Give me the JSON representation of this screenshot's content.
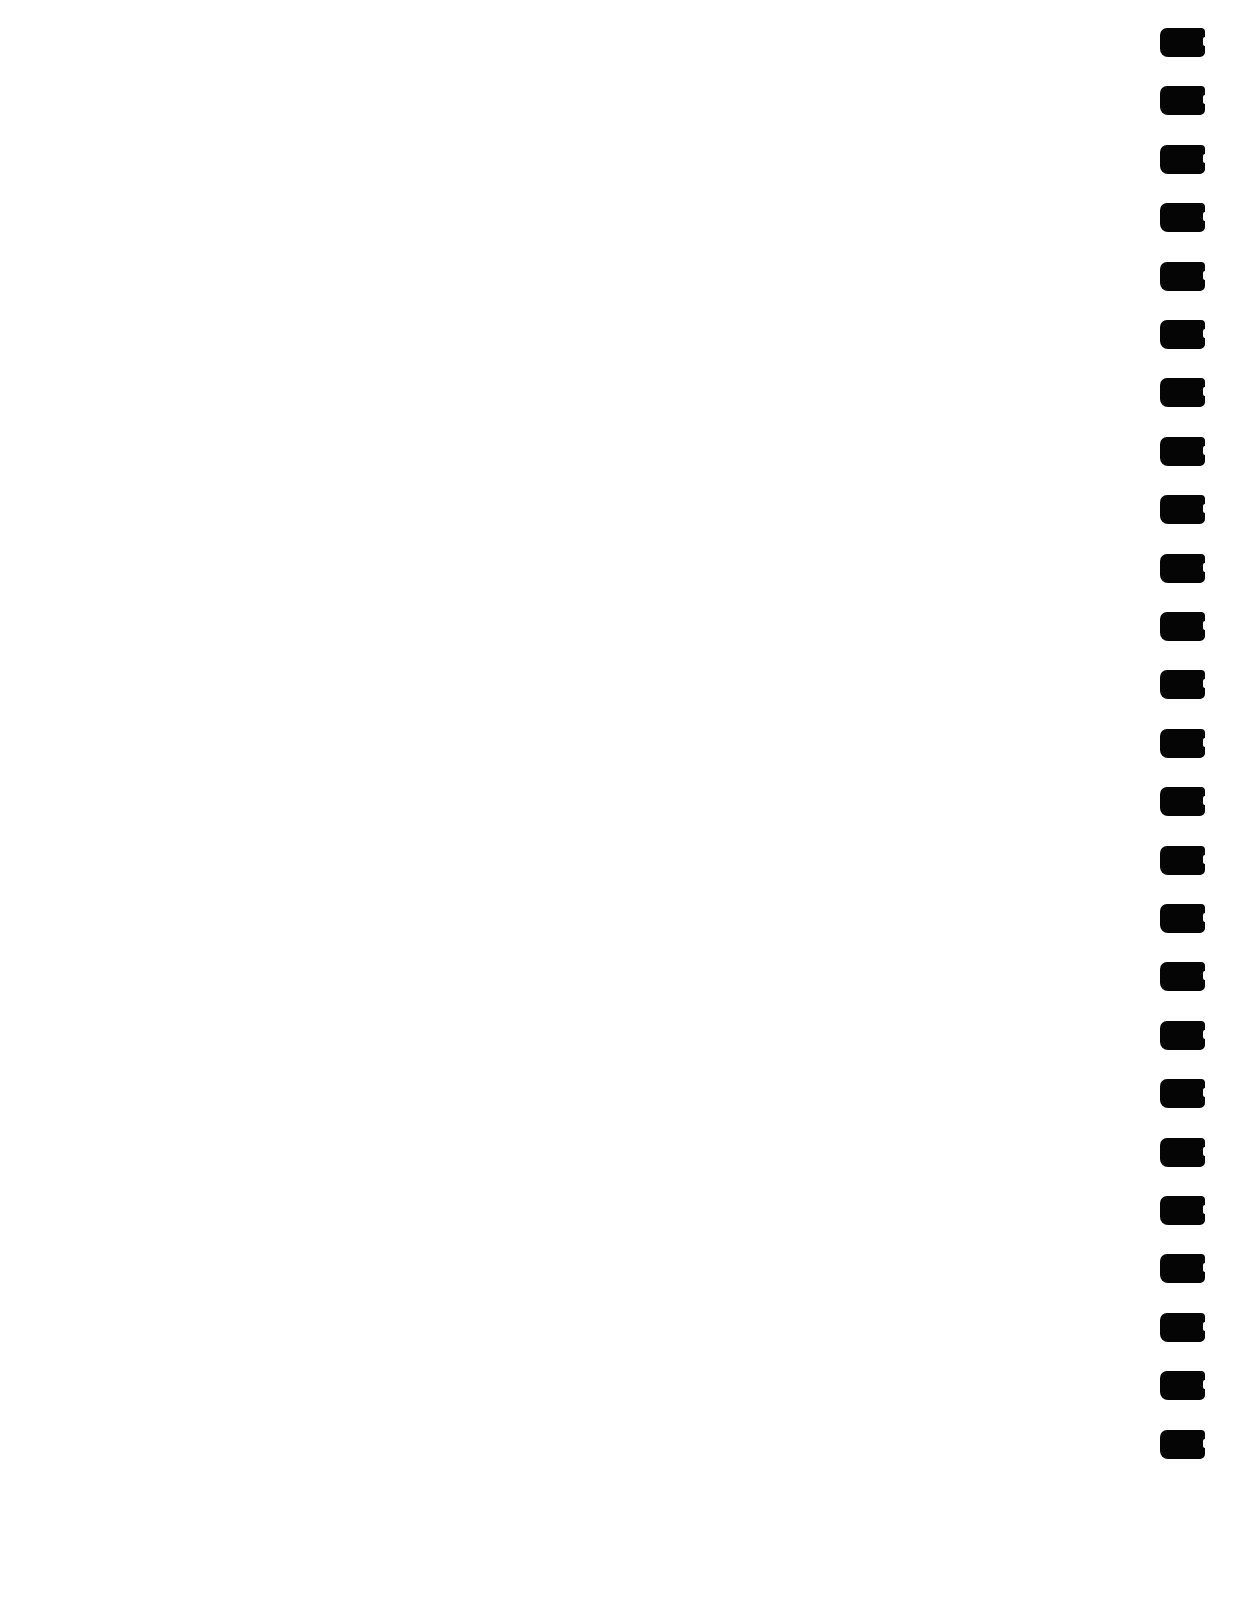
{
  "page": {
    "background": "#ffffff",
    "content_text": ""
  },
  "binding": {
    "side": "right",
    "hole_color": "#050505",
    "hole_count": 25,
    "hole_top_first": 28,
    "hole_spacing": 58.4
  }
}
